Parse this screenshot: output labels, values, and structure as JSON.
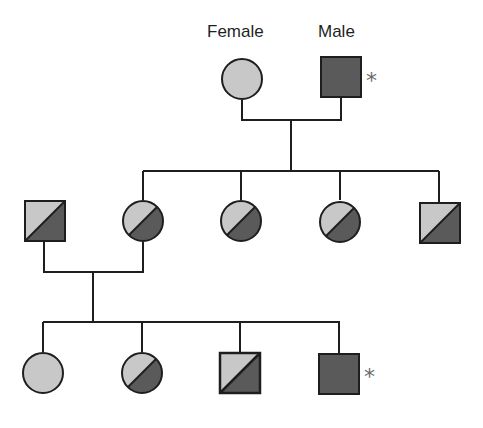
{
  "legend": {
    "female_label": "Female",
    "male_label": "Male",
    "marker": "*"
  },
  "colors": {
    "unaffected": "#c8c8c8",
    "affected": "#5a5a5a",
    "outline": "#1e1e1e",
    "line": "#1e1e1e",
    "marker": "#6a6a6a"
  },
  "pedigree": {
    "generation_1": [
      {
        "sex": "female",
        "status": "unaffected",
        "label": "Female"
      },
      {
        "sex": "male",
        "status": "affected",
        "label": "Male",
        "marked": true
      }
    ],
    "generation_2": [
      {
        "sex": "male",
        "status": "carrier",
        "married_in": true
      },
      {
        "sex": "female",
        "status": "carrier"
      },
      {
        "sex": "female",
        "status": "carrier"
      },
      {
        "sex": "female",
        "status": "carrier"
      },
      {
        "sex": "male",
        "status": "carrier"
      }
    ],
    "generation_3": [
      {
        "sex": "female",
        "status": "unaffected"
      },
      {
        "sex": "female",
        "status": "carrier"
      },
      {
        "sex": "male",
        "status": "carrier"
      },
      {
        "sex": "male",
        "status": "affected",
        "marked": true
      }
    ]
  }
}
